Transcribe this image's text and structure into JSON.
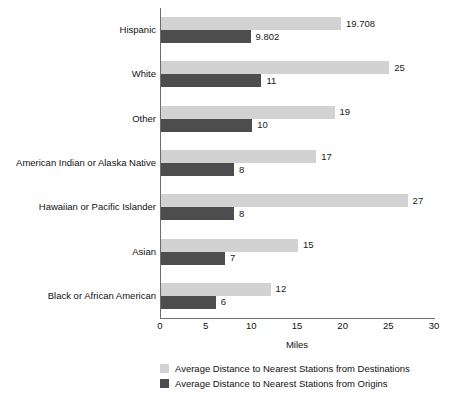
{
  "chart_data": {
    "type": "bar",
    "orientation": "horizontal",
    "title": "",
    "xlabel": "Miles",
    "ylabel": "",
    "xlim": [
      0,
      30
    ],
    "xticks": [
      0,
      5,
      10,
      15,
      20,
      25,
      30
    ],
    "xtick_labels": [
      "0",
      "5",
      "10",
      "15",
      "20",
      "25",
      "30"
    ],
    "grid": false,
    "legend_position": "bottom-left",
    "categories": [
      "Hispanic",
      "White",
      "Other",
      "American Indian or Alaska Native",
      "Hawaiian or Pacific Islander",
      "Asian",
      "Black or African American"
    ],
    "series": [
      {
        "name": "Average Distance to Nearest Stations from Destinations",
        "color": "#d2d2d2",
        "values": [
          19.708,
          25,
          19,
          17,
          27,
          15,
          12
        ],
        "labels": [
          "19.708",
          "25",
          "19",
          "17",
          "27",
          "15",
          "12"
        ]
      },
      {
        "name": "Average Distance to Nearest Stations from Origins",
        "color": "#4d4d4d",
        "values": [
          9.802,
          11,
          10,
          8,
          8,
          7,
          6
        ],
        "labels": [
          "9.802",
          "11",
          "10",
          "8",
          "8",
          "7",
          "6"
        ]
      }
    ]
  },
  "axis": {
    "x_title": "Miles",
    "ticks": [
      "0",
      "5",
      "10",
      "15",
      "20",
      "25",
      "30"
    ]
  },
  "legend": {
    "items": [
      {
        "label": "Average Distance to Nearest Stations from Destinations",
        "color": "#d2d2d2"
      },
      {
        "label": "Average Distance to Nearest Stations from Origins",
        "color": "#4d4d4d"
      }
    ]
  },
  "colors": {
    "destinations": "#d2d2d2",
    "origins": "#4d4d4d",
    "axis": "#6d6d6d",
    "text": "#111111",
    "background": "#ffffff"
  }
}
